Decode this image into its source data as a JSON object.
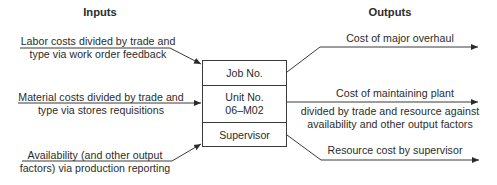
{
  "headers": {
    "inputs": "Inputs",
    "outputs": "Outputs"
  },
  "inputs": [
    {
      "line1": "Labor costs divided by trade and",
      "line2": "type via work order feedback"
    },
    {
      "line1": "Material costs divided by trade and",
      "line2": "type via stores requisitions"
    },
    {
      "line1": "Availability (and other output",
      "line2": "factors) via production reporting"
    }
  ],
  "box": {
    "cells": [
      {
        "line1": "Job No."
      },
      {
        "line1": "Unit No.",
        "line2": "06–M02"
      },
      {
        "line1": "Supervisor"
      }
    ]
  },
  "outputs": [
    {
      "line1": "Cost of major overhaul"
    },
    {
      "line1": "Cost of maintaining plant"
    },
    {
      "line1": "divided by trade and resource against",
      "line2": "availability and other output factors"
    },
    {
      "line1": "Resource cost by supervisor"
    }
  ],
  "colors": {
    "line": "#3a3a3a",
    "text": "#2b2b2b",
    "background": "#ffffff"
  }
}
